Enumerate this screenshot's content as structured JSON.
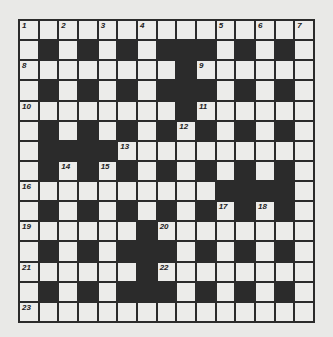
{
  "puzzle": {
    "rows": 15,
    "cols": 15,
    "colors": {
      "background": "#e9e9e7",
      "white_cell": "#ececea",
      "black_cell": "#2b2b2b"
    },
    "layout": [
      "...............",
      ".#.#.#.###.#.#.",
      "........#......",
      ".#.#.#.###.#.#.",
      "........#......",
      ".#.#.#.#.#.#.#.",
      ".####..........",
      ".#.#.#.#.#.#.#.",
      "..........####.",
      ".#.#.#.#.#.#.#.",
      "......#........",
      ".#.#.###.#.#.#.",
      "......#........",
      ".#.#.###.#.#.#.",
      "..............."
    ],
    "numbers": [
      {
        "n": "1",
        "r": 0,
        "c": 0
      },
      {
        "n": "2",
        "r": 0,
        "c": 2
      },
      {
        "n": "3",
        "r": 0,
        "c": 4
      },
      {
        "n": "4",
        "r": 0,
        "c": 6
      },
      {
        "n": "5",
        "r": 0,
        "c": 10
      },
      {
        "n": "6",
        "r": 0,
        "c": 12
      },
      {
        "n": "7",
        "r": 0,
        "c": 14
      },
      {
        "n": "8",
        "r": 2,
        "c": 0
      },
      {
        "n": "9",
        "r": 2,
        "c": 9
      },
      {
        "n": "10",
        "r": 4,
        "c": 0
      },
      {
        "n": "11",
        "r": 4,
        "c": 9
      },
      {
        "n": "12",
        "r": 5,
        "c": 8
      },
      {
        "n": "13",
        "r": 6,
        "c": 5
      },
      {
        "n": "14",
        "r": 7,
        "c": 2
      },
      {
        "n": "15",
        "r": 7,
        "c": 4
      },
      {
        "n": "16",
        "r": 8,
        "c": 0
      },
      {
        "n": "17",
        "r": 9,
        "c": 10
      },
      {
        "n": "18",
        "r": 9,
        "c": 12
      },
      {
        "n": "19",
        "r": 10,
        "c": 0
      },
      {
        "n": "20",
        "r": 10,
        "c": 7
      },
      {
        "n": "21",
        "r": 12,
        "c": 0
      },
      {
        "n": "22",
        "r": 12,
        "c": 7
      },
      {
        "n": "23",
        "r": 14,
        "c": 0
      }
    ]
  }
}
